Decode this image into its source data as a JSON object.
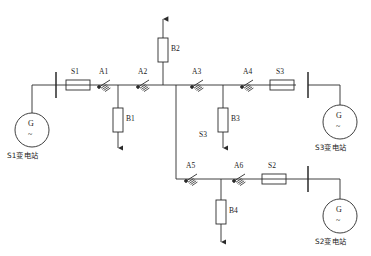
{
  "diagram": {
    "type": "electrical-single-line-diagram",
    "title": "",
    "stroke_color": "#2a2a2a",
    "background": "#ffffff"
  },
  "substations": [
    {
      "id": "S1",
      "label": "S1变电站",
      "generator_symbol": "G",
      "waveform_symbol": "~",
      "position": "left"
    },
    {
      "id": "S3",
      "label": "S3变电站",
      "generator_symbol": "G",
      "waveform_symbol": "~",
      "position": "right-upper"
    },
    {
      "id": "S2",
      "label": "S2变电站",
      "generator_symbol": "G",
      "waveform_symbol": "~",
      "position": "right-lower"
    }
  ],
  "switches": [
    {
      "id": "S1",
      "label": "S1",
      "kind": "breaker-box",
      "orientation": "horizontal",
      "branch": "main-upper"
    },
    {
      "id": "S3",
      "label": "S3",
      "kind": "breaker-box",
      "orientation": "horizontal",
      "branch": "main-upper-right"
    },
    {
      "id": "S2",
      "label": "S2",
      "kind": "breaker-box",
      "orientation": "horizontal",
      "branch": "lower"
    }
  ],
  "arresters": [
    {
      "id": "A1",
      "label": "A1",
      "branch": "main-upper"
    },
    {
      "id": "A2",
      "label": "A2",
      "branch": "main-upper"
    },
    {
      "id": "A3",
      "label": "A3",
      "branch": "main-upper-right"
    },
    {
      "id": "A4",
      "label": "A4",
      "branch": "main-upper-right"
    },
    {
      "id": "A5",
      "label": "A5",
      "branch": "lower"
    },
    {
      "id": "A6",
      "label": "A6",
      "branch": "lower"
    }
  ],
  "loads": [
    {
      "id": "B1",
      "label": "B1",
      "direction": "down",
      "branch": "main-upper"
    },
    {
      "id": "B2",
      "label": "B2",
      "direction": "up",
      "branch": "vertical-top"
    },
    {
      "id": "B3",
      "label": "B3",
      "direction": "down",
      "branch": "main-upper-right"
    },
    {
      "id": "B4",
      "label": "B4",
      "direction": "down",
      "branch": "lower"
    }
  ],
  "annotations": [
    {
      "id": "S3-tap",
      "label": "S3",
      "near": "B3"
    }
  ]
}
